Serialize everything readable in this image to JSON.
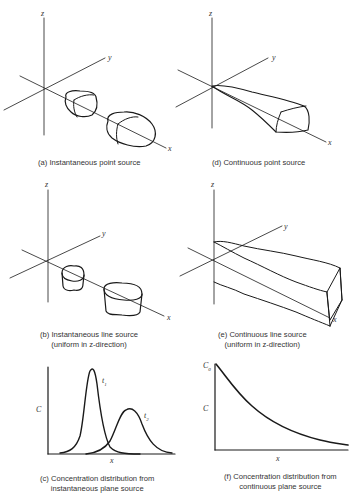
{
  "panels": {
    "a": {
      "caption": "(a) Instantaneous point source",
      "axes": {
        "z": "z",
        "y": "y",
        "x": "x"
      }
    },
    "b": {
      "caption_line1": "(b) Instantaneous line source",
      "caption_line2": "(uniform in z-direction)",
      "axes": {
        "z": "z",
        "y": "y",
        "x": "x"
      }
    },
    "c": {
      "caption_line1": "(c) Concentration distribution from",
      "caption_line2": "instantaneous plane source",
      "ylabel": "C",
      "xlabel": "x",
      "curve_labels": {
        "t1": "t",
        "t1_sub": "1",
        "t2": "t",
        "t2_sub": "2"
      }
    },
    "d": {
      "caption": "(d) Continuous point source",
      "axes": {
        "z": "z",
        "y": "y",
        "x": "x"
      }
    },
    "e": {
      "caption_line1": "(e) Continuous line source",
      "caption_line2": "(uniform in z-direction)",
      "axes": {
        "z": "z",
        "y": "y",
        "x": "x"
      }
    },
    "f": {
      "caption_line1": "(f) Concentration distribution from",
      "caption_line2": "continuous plane source",
      "ylabel": "C",
      "xlabel": "x",
      "c0": "C",
      "c0_sub": "0"
    }
  },
  "colors": {
    "ink": "#1a1a1a",
    "background": "#ffffff"
  }
}
